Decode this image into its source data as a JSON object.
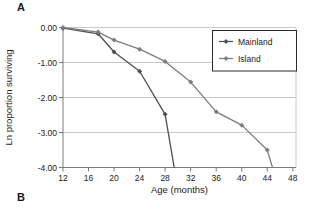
{
  "figure": {
    "panel_a_label": "A",
    "panel_b_label": "B"
  },
  "chart_data": {
    "type": "line",
    "title": "",
    "xlabel": "Age (months)",
    "ylabel": "Ln proportion surviving",
    "xlim": [
      12,
      48.5
    ],
    "ylim": [
      -4,
      0
    ],
    "x_ticks": [
      12,
      16,
      20,
      24,
      28,
      32,
      36,
      40,
      44,
      48
    ],
    "y_ticks": [
      0,
      -1,
      -2,
      -3,
      -4
    ],
    "y_tick_labels": [
      "0.00",
      "-1.00",
      "-2.00",
      "-3.00",
      "-4.00"
    ],
    "grid": true,
    "legend": {
      "position": "top-right",
      "entries": [
        "Mainland",
        "Island"
      ]
    },
    "series": [
      {
        "name": "Mainland",
        "color": "#4f4f4f",
        "marker": "diamond",
        "x": [
          12,
          17.5,
          20,
          24,
          28,
          29.7
        ],
        "y": [
          -0.02,
          -0.18,
          -0.7,
          -1.25,
          -2.48,
          -4.3
        ],
        "last_point_runs_offscale": true
      },
      {
        "name": "Island",
        "color": "#7d7d7d",
        "marker": "diamond",
        "x": [
          12,
          17.5,
          20,
          24,
          28,
          32,
          36,
          40,
          44,
          45.3
        ],
        "y": [
          0.0,
          -0.13,
          -0.36,
          -0.62,
          -0.97,
          -1.56,
          -2.41,
          -2.79,
          -3.5,
          -4.3
        ],
        "last_point_runs_offscale": true
      }
    ]
  },
  "colors": {
    "background": "#ffffff",
    "gridline": "#c9c9c9",
    "axis": "#7a7a7a",
    "text": "#1a1a1a",
    "legend_border": "#2b2b2b",
    "legend_fill": "#ffffff"
  }
}
